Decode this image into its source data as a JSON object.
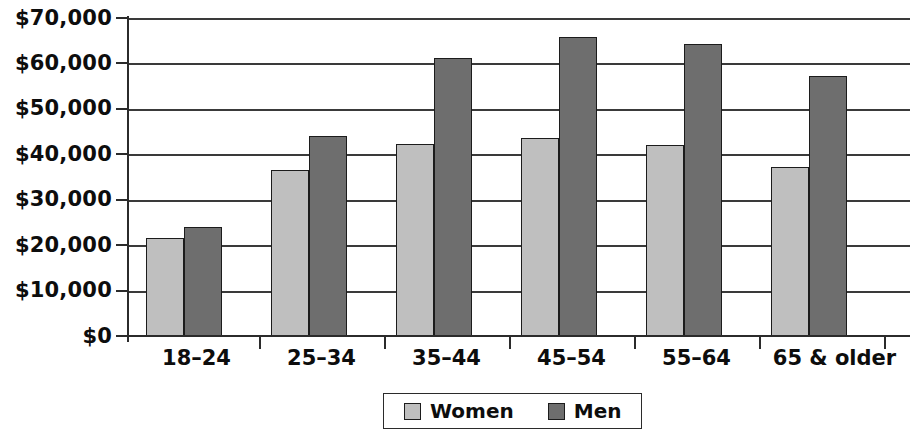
{
  "chart_data": {
    "type": "bar",
    "title": "",
    "subtitle": "",
    "xlabel": "",
    "ylabel": "",
    "categories": [
      "18–24",
      "25–34",
      "35–44",
      "45–54",
      "55–64",
      "65 & older"
    ],
    "series": [
      {
        "name": "Women",
        "color": "#bfbfbf",
        "values": [
          21500,
          36500,
          42200,
          43600,
          42000,
          37300
        ]
      },
      {
        "name": "Men",
        "color": "#6e6e6e",
        "values": [
          23900,
          44000,
          61200,
          65800,
          64300,
          57200
        ]
      }
    ],
    "ylim": [
      0,
      70000
    ],
    "ytick_values": [
      0,
      10000,
      20000,
      30000,
      40000,
      50000,
      60000,
      70000
    ],
    "ytick_labels": [
      "$0",
      "$10,000",
      "$20,000",
      "$30,000",
      "$40,000",
      "$50,000",
      "$60,000",
      "$70,000"
    ],
    "grid": true,
    "grid_axis": "y",
    "legend_position": "bottom-center",
    "legend_entries": [
      "Women",
      "Men"
    ],
    "annotations": []
  },
  "legend": {
    "items": [
      {
        "label": "Women",
        "swatch": "legend-swatch-women"
      },
      {
        "label": "Men",
        "swatch": "legend-swatch-men"
      }
    ]
  },
  "colors": {
    "women_fill": "#bfbfbf",
    "men_fill": "#6e6e6e",
    "bar_outline": "#1c1c1c",
    "axis": "#2b2b2b",
    "gridline": "#3a3a3a",
    "background": "#ffffff",
    "text": "#0d0d0d"
  }
}
